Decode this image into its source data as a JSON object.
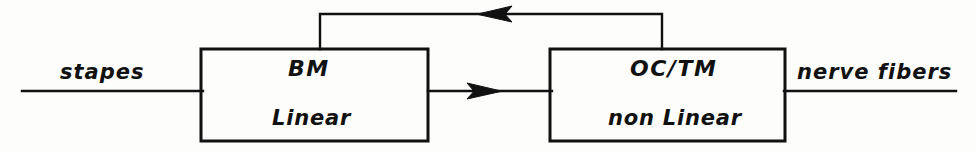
{
  "diagram": {
    "style": {
      "stroke": "#111111",
      "background": "#fdfdfc",
      "line_width": 2
    },
    "blocks": [
      {
        "id": "bm",
        "title": "BM",
        "subtitle": "Linear",
        "x": 201,
        "y": 49,
        "width": 227,
        "height": 92
      },
      {
        "id": "octm",
        "title": "OC/TM",
        "subtitle": "non Linear",
        "x": 550,
        "y": 49,
        "width": 235,
        "height": 92
      }
    ],
    "edges": [
      {
        "id": "input",
        "label": "stapes",
        "from": "external-input",
        "to": "bm",
        "direction": "right",
        "arrowhead": false
      },
      {
        "id": "bm-to-octm",
        "label": "",
        "from": "bm",
        "to": "octm",
        "direction": "right",
        "arrowhead": true
      },
      {
        "id": "output",
        "label": "nerve fibers",
        "from": "octm",
        "to": "external-output",
        "direction": "right",
        "arrowhead": false
      },
      {
        "id": "feedback",
        "label": "",
        "from": "octm",
        "to": "bm",
        "direction": "left",
        "arrowhead": true
      }
    ]
  }
}
